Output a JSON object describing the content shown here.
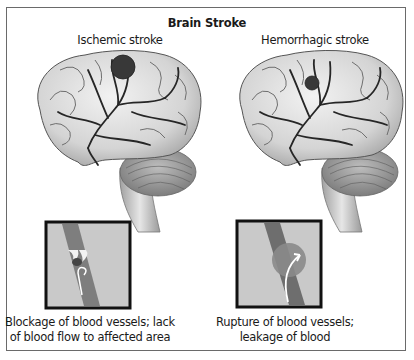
{
  "figure": {
    "title": "Brain Stroke",
    "panels": [
      {
        "id": "ischemic",
        "label": "Ischemic stroke",
        "caption_line1": "Blockage of blood vessels; lack",
        "caption_line2": "of blood flow to affected area",
        "lesion": "clot-blockage",
        "inset": "blocked-vessel-with-reversed-flow-arrow"
      },
      {
        "id": "hemorrhagic",
        "label": "Hemorrhagic stroke",
        "caption_line1": "Rupture of blood vessels;",
        "caption_line2": "leakage of blood",
        "lesion": "bleed",
        "inset": "ruptured-vessel-with-leak-arrow"
      }
    ],
    "colors": {
      "frame": "#6a6a6a",
      "brain_fill": "#d9d9d9",
      "vessel": "#2b2b2b",
      "lesion": "#3a3a3a",
      "inset_bg": "#c8c8c8",
      "inset_border": "#111111"
    }
  }
}
